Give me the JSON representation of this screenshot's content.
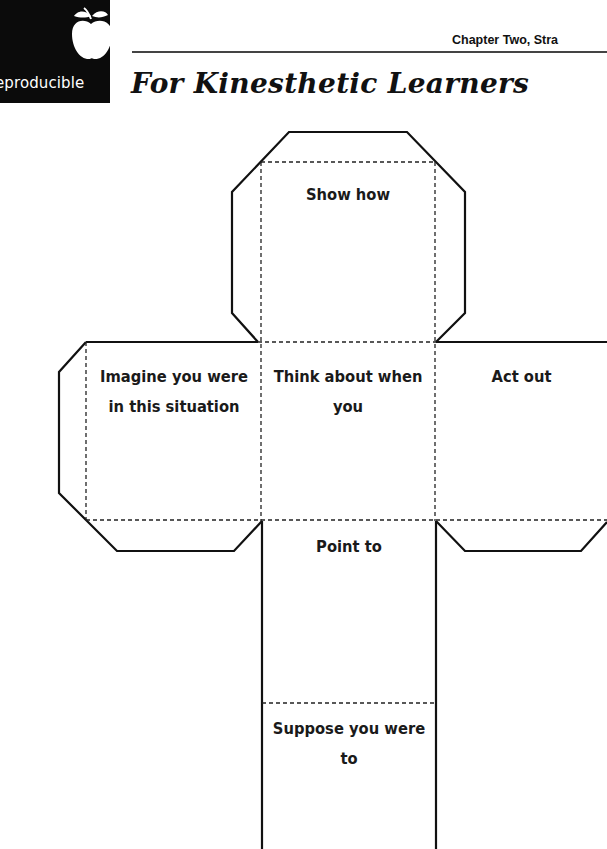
{
  "header": {
    "badge_label": "eproducible",
    "badge_icon": "apple-icon",
    "chapter_label": "Chapter Two, Stra",
    "page_title": "For Kinesthetic Learners"
  },
  "cube_net": {
    "faces": {
      "top": {
        "label": "Show how"
      },
      "left": {
        "label": "Imagine you were in this situation",
        "line1": "Imagine you were",
        "line2": "in this situation"
      },
      "center": {
        "label": "Think about when you",
        "line1": "Think about when",
        "line2": "you"
      },
      "right": {
        "label": "Act out"
      },
      "lower": {
        "label": "Point to"
      },
      "bottom": {
        "label": "Suppose you were to",
        "line1": "Suppose you were",
        "line2": "to"
      }
    },
    "colors": {
      "cut_line": "#111111",
      "fold_line": "#222222"
    }
  }
}
